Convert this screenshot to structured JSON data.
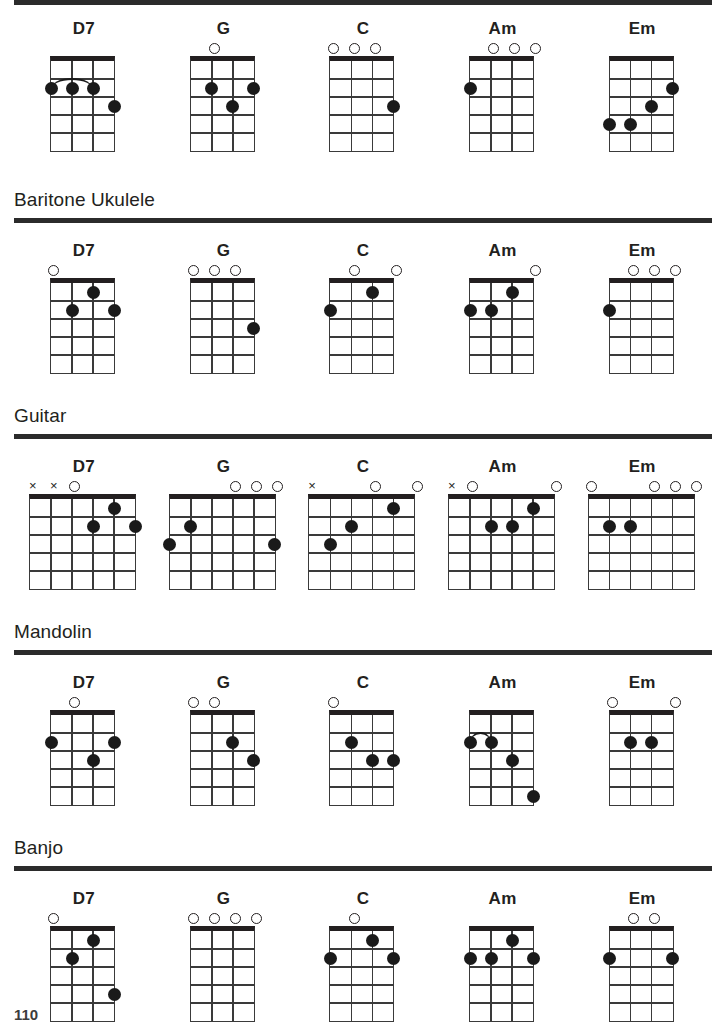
{
  "page": {
    "number": "110",
    "chord_names": [
      "D7",
      "G",
      "C",
      "Am",
      "Em"
    ]
  },
  "sections": [
    {
      "id": "ukulele",
      "title": "",
      "show_title": false,
      "strings": 4,
      "frets": 5,
      "chords": [
        {
          "name": "D7",
          "markers": [
            "",
            "",
            "",
            ""
          ],
          "dots": [
            {
              "string": 1,
              "fret": 2
            },
            {
              "string": 2,
              "fret": 2
            },
            {
              "string": 3,
              "fret": 2
            },
            {
              "string": 4,
              "fret": 3
            }
          ],
          "barre": {
            "fret": 2,
            "from": 1,
            "to": 3
          }
        },
        {
          "name": "G",
          "markers": [
            "",
            "o",
            "",
            ""
          ],
          "dots": [
            {
              "string": 2,
              "fret": 2
            },
            {
              "string": 4,
              "fret": 2
            },
            {
              "string": 3,
              "fret": 3
            }
          ],
          "barre": null
        },
        {
          "name": "C",
          "markers": [
            "o",
            "o",
            "o",
            ""
          ],
          "dots": [
            {
              "string": 4,
              "fret": 3
            }
          ],
          "barre": null
        },
        {
          "name": "Am",
          "markers": [
            "",
            "o",
            "o",
            "o"
          ],
          "dots": [
            {
              "string": 1,
              "fret": 2
            }
          ],
          "barre": null
        },
        {
          "name": "Em",
          "markers": [
            "",
            "",
            "",
            ""
          ],
          "dots": [
            {
              "string": 4,
              "fret": 2
            },
            {
              "string": 3,
              "fret": 3
            },
            {
              "string": 1,
              "fret": 4
            },
            {
              "string": 2,
              "fret": 4
            }
          ],
          "barre": null
        }
      ]
    },
    {
      "id": "baritone-ukulele",
      "title": "Baritone Ukulele",
      "show_title": true,
      "strings": 4,
      "frets": 5,
      "chords": [
        {
          "name": "D7",
          "markers": [
            "o",
            "",
            "",
            ""
          ],
          "dots": [
            {
              "string": 3,
              "fret": 1
            },
            {
              "string": 2,
              "fret": 2
            },
            {
              "string": 4,
              "fret": 2
            }
          ],
          "barre": null
        },
        {
          "name": "G",
          "markers": [
            "o",
            "o",
            "o",
            ""
          ],
          "dots": [
            {
              "string": 4,
              "fret": 3
            }
          ],
          "barre": null
        },
        {
          "name": "C",
          "markers": [
            "",
            "o",
            "",
            "o"
          ],
          "dots": [
            {
              "string": 3,
              "fret": 1
            },
            {
              "string": 1,
              "fret": 2
            }
          ],
          "barre": null
        },
        {
          "name": "Am",
          "markers": [
            "",
            "",
            "",
            "o"
          ],
          "dots": [
            {
              "string": 3,
              "fret": 1
            },
            {
              "string": 1,
              "fret": 2
            },
            {
              "string": 2,
              "fret": 2
            }
          ],
          "barre": null
        },
        {
          "name": "Em",
          "markers": [
            "",
            "o",
            "o",
            "o"
          ],
          "dots": [
            {
              "string": 1,
              "fret": 2
            }
          ],
          "barre": null
        }
      ]
    },
    {
      "id": "guitar",
      "title": "Guitar",
      "show_title": true,
      "strings": 6,
      "frets": 5,
      "chords": [
        {
          "name": "D7",
          "markers": [
            "x",
            "x",
            "o",
            "",
            "",
            ""
          ],
          "dots": [
            {
              "string": 5,
              "fret": 1
            },
            {
              "string": 4,
              "fret": 2
            },
            {
              "string": 6,
              "fret": 2
            }
          ],
          "barre": null
        },
        {
          "name": "G",
          "markers": [
            "",
            "",
            "",
            "o",
            "o",
            "o"
          ],
          "dots": [
            {
              "string": 1,
              "fret": 3
            },
            {
              "string": 6,
              "fret": 3
            },
            {
              "string": 2,
              "fret": 2
            }
          ],
          "barre": null
        },
        {
          "name": "C",
          "markers": [
            "x",
            "",
            "",
            "o",
            "",
            "o"
          ],
          "dots": [
            {
              "string": 2,
              "fret": 3
            },
            {
              "string": 3,
              "fret": 2
            },
            {
              "string": 5,
              "fret": 1
            }
          ],
          "barre": null
        },
        {
          "name": "Am",
          "markers": [
            "x",
            "o",
            "",
            "",
            "",
            "o"
          ],
          "dots": [
            {
              "string": 5,
              "fret": 1
            },
            {
              "string": 3,
              "fret": 2
            },
            {
              "string": 4,
              "fret": 2
            }
          ],
          "barre": null
        },
        {
          "name": "Em",
          "markers": [
            "o",
            "",
            "",
            "o",
            "o",
            "o"
          ],
          "dots": [
            {
              "string": 2,
              "fret": 2
            },
            {
              "string": 3,
              "fret": 2
            }
          ],
          "barre": null
        }
      ]
    },
    {
      "id": "mandolin",
      "title": "Mandolin",
      "show_title": true,
      "strings": 4,
      "frets": 5,
      "chords": [
        {
          "name": "D7",
          "markers": [
            "",
            "o",
            "",
            ""
          ],
          "dots": [
            {
              "string": 1,
              "fret": 2
            },
            {
              "string": 4,
              "fret": 2
            },
            {
              "string": 3,
              "fret": 3
            }
          ],
          "barre": null
        },
        {
          "name": "G",
          "markers": [
            "o",
            "o",
            "",
            ""
          ],
          "dots": [
            {
              "string": 3,
              "fret": 2
            },
            {
              "string": 4,
              "fret": 3
            }
          ],
          "barre": null
        },
        {
          "name": "C",
          "markers": [
            "o",
            "",
            "",
            ""
          ],
          "dots": [
            {
              "string": 2,
              "fret": 2
            },
            {
              "string": 3,
              "fret": 3
            },
            {
              "string": 4,
              "fret": 3
            }
          ],
          "barre": null
        },
        {
          "name": "Am",
          "markers": [
            "",
            "",
            "",
            ""
          ],
          "dots": [
            {
              "string": 1,
              "fret": 2
            },
            {
              "string": 2,
              "fret": 2
            },
            {
              "string": 3,
              "fret": 3
            },
            {
              "string": 4,
              "fret": 5
            }
          ],
          "barre": {
            "fret": 2,
            "from": 1,
            "to": 2
          }
        },
        {
          "name": "Em",
          "markers": [
            "o",
            "",
            "",
            "o"
          ],
          "dots": [
            {
              "string": 2,
              "fret": 2
            },
            {
              "string": 3,
              "fret": 2
            }
          ],
          "barre": null
        }
      ]
    },
    {
      "id": "banjo",
      "title": "Banjo",
      "show_title": true,
      "strings": 4,
      "frets": 5,
      "chords": [
        {
          "name": "D7",
          "markers": [
            "o",
            "",
            "",
            ""
          ],
          "dots": [
            {
              "string": 3,
              "fret": 1
            },
            {
              "string": 2,
              "fret": 2
            },
            {
              "string": 4,
              "fret": 4
            }
          ],
          "barre": null
        },
        {
          "name": "G",
          "markers": [
            "o",
            "o",
            "o",
            "o"
          ],
          "dots": [],
          "barre": null
        },
        {
          "name": "C",
          "markers": [
            "",
            "o",
            "",
            ""
          ],
          "dots": [
            {
              "string": 3,
              "fret": 1
            },
            {
              "string": 1,
              "fret": 2
            },
            {
              "string": 4,
              "fret": 2
            }
          ],
          "barre": null
        },
        {
          "name": "Am",
          "markers": [
            "",
            "",
            "",
            ""
          ],
          "dots": [
            {
              "string": 3,
              "fret": 1
            },
            {
              "string": 1,
              "fret": 2
            },
            {
              "string": 2,
              "fret": 2
            },
            {
              "string": 4,
              "fret": 2
            }
          ],
          "barre": null
        },
        {
          "name": "Em",
          "markers": [
            "",
            "o",
            "o",
            ""
          ],
          "dots": [
            {
              "string": 1,
              "fret": 2
            },
            {
              "string": 4,
              "fret": 2
            }
          ],
          "barre": null
        }
      ]
    }
  ]
}
